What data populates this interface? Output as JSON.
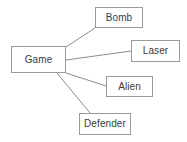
{
  "diagram": {
    "type": "node-link-graph",
    "title": "",
    "background_color": "#ffffff",
    "node_border_color": "#9a9a9a",
    "node_fill_color": "#ffffff",
    "edge_color": "#8c8c8c",
    "text_color": "#3c3c3c",
    "root": {
      "id": "game",
      "label": "Game",
      "x": 11,
      "y": 46,
      "width": 55,
      "height": 27
    },
    "nodes": [
      {
        "id": "bomb",
        "label": "Bomb",
        "x": 95,
        "y": 7,
        "width": 48,
        "height": 21
      },
      {
        "id": "laser",
        "label": "Laser",
        "x": 131,
        "y": 40,
        "width": 49,
        "height": 22
      },
      {
        "id": "alien",
        "label": "Alien",
        "x": 106,
        "y": 76,
        "width": 47,
        "height": 21
      },
      {
        "id": "defender",
        "label": "Defender",
        "x": 79,
        "y": 113,
        "width": 52,
        "height": 22
      }
    ],
    "edges": [
      {
        "id": "game-bomb",
        "from": "game",
        "to": "bomb",
        "x1": 66,
        "y1": 47,
        "x2": 95,
        "y2": 28
      },
      {
        "id": "game-laser",
        "from": "game",
        "to": "laser",
        "x1": 66,
        "y1": 60,
        "x2": 131,
        "y2": 51
      },
      {
        "id": "game-alien",
        "from": "game",
        "to": "alien",
        "x1": 66,
        "y1": 73,
        "x2": 106,
        "y2": 86
      },
      {
        "id": "game-defender",
        "from": "game",
        "to": "defender",
        "x1": 57,
        "y1": 73,
        "x2": 90,
        "y2": 113
      }
    ]
  }
}
